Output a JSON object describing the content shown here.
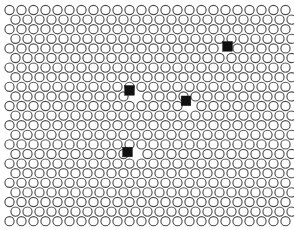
{
  "figure": {
    "canvas": {
      "width": 294,
      "height": 230,
      "background": "#ffffff"
    }
  },
  "lattice": {
    "type": "staggered-circle-packing",
    "origin_x": 9.5,
    "origin_y": 10.0,
    "col_spacing": 12.0,
    "row_spacing": 9.6,
    "row_offset": 6.0,
    "columns": 24,
    "rows": 23,
    "circle_radius": 4.6,
    "circle_fill": "#ffffff",
    "circle_stroke": "#4d4d4d",
    "circle_stroke_width": 1.15
  },
  "defects": {
    "marker_shape": "square",
    "marker_fill": "#111111",
    "marker_stroke": "#111111",
    "marker_size": 9.6,
    "count": 4,
    "sites": [
      {
        "label": "defect-1",
        "row": 4,
        "col": 18,
        "cx": 227.5,
        "cy": 46.4
      },
      {
        "label": "defect-2",
        "row": 9,
        "col": 10,
        "cx": 129.5,
        "cy": 90.4
      },
      {
        "label": "defect-3",
        "row": 10,
        "col": 15,
        "cx": 186.0,
        "cy": 100.8
      },
      {
        "label": "defect-4",
        "row": 15,
        "col": 10,
        "cx": 127.5,
        "cy": 152.0
      }
    ]
  }
}
